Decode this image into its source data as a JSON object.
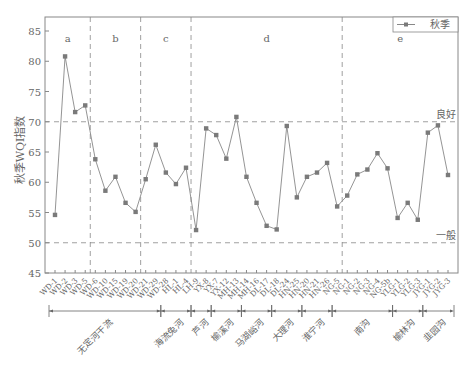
{
  "chart_data": {
    "type": "line",
    "title": "",
    "xlabel": "",
    "ylabel": "秋季WQI指数",
    "ylim": [
      45,
      87
    ],
    "yticks": [
      45,
      50,
      55,
      60,
      65,
      70,
      75,
      80,
      85
    ],
    "grid": false,
    "legend": {
      "position": "top-right",
      "entries": [
        "秋季"
      ]
    },
    "reference_lines": [
      {
        "value": 70,
        "label": "良好"
      },
      {
        "value": 50,
        "label": "一般"
      }
    ],
    "sections": [
      {
        "label": "a",
        "start": 0,
        "end": 3
      },
      {
        "label": "b",
        "start": 4,
        "end": 8
      },
      {
        "label": "c",
        "start": 9,
        "end": 13
      },
      {
        "label": "d",
        "start": 14,
        "end": 28
      },
      {
        "label": "e",
        "start": 29,
        "end": 39
      }
    ],
    "rivers": [
      {
        "label": "无定河干流",
        "start": 0,
        "end": 10
      },
      {
        "label": "海流兔河",
        "start": 11,
        "end": 13
      },
      {
        "label": "芦河",
        "start": 14,
        "end": 15
      },
      {
        "label": "榆溪河",
        "start": 16,
        "end": 18
      },
      {
        "label": "马湖峪河",
        "start": 19,
        "end": 21
      },
      {
        "label": "大理河",
        "start": 22,
        "end": 24
      },
      {
        "label": "淮宁河",
        "start": 25,
        "end": 27
      },
      {
        "label": "南沟",
        "start": 28,
        "end": 33
      },
      {
        "label": "榆林沟",
        "start": 34,
        "end": 36
      },
      {
        "label": "韭园沟",
        "start": 37,
        "end": 39
      }
    ],
    "categories": [
      "WD-1",
      "WD-2",
      "WD-3",
      "WD-5",
      "WD-6",
      "WD-10",
      "WD-15",
      "WD-19",
      "WD-20",
      "WD-21",
      "WD-29",
      "WD-28",
      "HL-1",
      "HL-4",
      "LH-9",
      "YX-8",
      "YX-7",
      "YX-12",
      "MH-13",
      "MH-14",
      "MH-16",
      "DL-17",
      "DL-18",
      "DL-24",
      "HN-25",
      "HN-20",
      "HN-21",
      "HN-26",
      "NG-5",
      "NG-1",
      "NG-2",
      "NG-3",
      "NG-4",
      "NG-5b",
      "YLG-1",
      "YLG-2",
      "YLG-3",
      "JYG-1",
      "JYG-2",
      "JYG-3"
    ],
    "series": [
      {
        "name": "秋季",
        "color": "#888888",
        "marker": "square",
        "values": [
          54.6,
          80.8,
          71.6,
          72.7,
          63.8,
          58.6,
          60.9,
          56.6,
          55.1,
          60.5,
          66.2,
          61.6,
          59.7,
          62.4,
          52.1,
          68.9,
          67.8,
          63.9,
          70.8,
          60.9,
          56.6,
          52.8,
          52.2,
          69.3,
          57.5,
          60.9,
          61.6,
          63.2,
          56.0,
          57.8,
          61.3,
          62.1,
          64.8,
          62.3,
          54.1,
          56.6,
          53.8,
          68.2,
          69.4,
          61.2
        ]
      }
    ]
  }
}
